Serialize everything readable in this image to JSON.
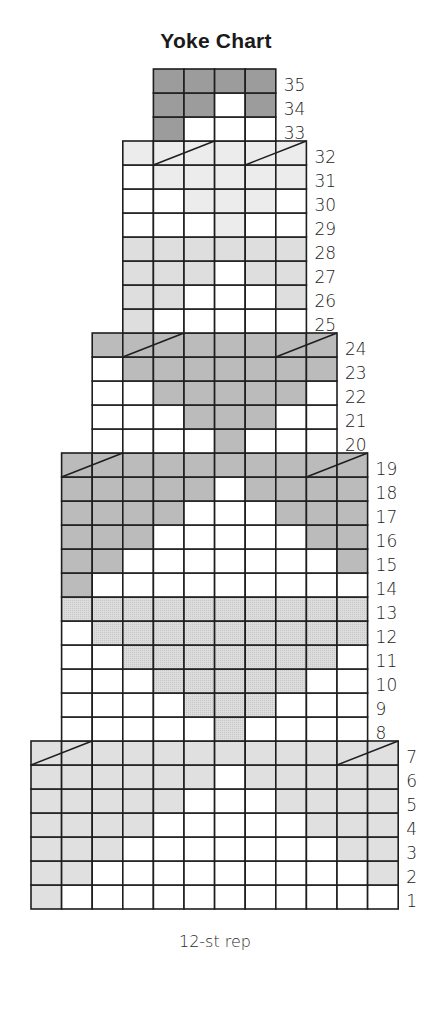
{
  "chart_data": {
    "type": "heatmap",
    "title": "Yoke Chart",
    "xlabel": "12-st rep",
    "ylabel": "",
    "legend": "none",
    "max_columns": 12,
    "shade_keys": {
      "W": {
        "name": "white",
        "color": "#ffffff"
      },
      "L": {
        "name": "light gray",
        "color": "#e0e0e0"
      },
      "D": {
        "name": "dotted light gray",
        "color": "#d9d9d9"
      },
      "M": {
        "name": "medium gray",
        "color": "#bbbbbb"
      },
      "P": {
        "name": "pale gray",
        "color": "#ececec"
      },
      "Q": {
        "name": "soft gray",
        "color": "#dedede"
      },
      "K": {
        "name": "dark gray",
        "color": "#9c9c9c"
      }
    },
    "rows": [
      {
        "row": 1,
        "cells": "LWWWWWWWWWWW"
      },
      {
        "row": 2,
        "cells": "LLWWWWWWWWWL"
      },
      {
        "row": 3,
        "cells": "LLLWWWWWWWLL"
      },
      {
        "row": 4,
        "cells": "LLLLWWWWWLLL"
      },
      {
        "row": 5,
        "cells": "LLLLLWWWLLLL"
      },
      {
        "row": 6,
        "cells": "LLLLLLWLLLLL"
      },
      {
        "row": 7,
        "cells": "LLLLLLLLLLLL",
        "decreases": [
          [
            1,
            2
          ],
          [
            11,
            12
          ]
        ]
      },
      {
        "row": 8,
        "cells": "WWWWWDWWWW"
      },
      {
        "row": 9,
        "cells": "WWWWDDDWWW"
      },
      {
        "row": 10,
        "cells": "WWWDDDDDWW"
      },
      {
        "row": 11,
        "cells": "WWDDDDDDDW"
      },
      {
        "row": 12,
        "cells": "WDDDDDDDDD"
      },
      {
        "row": 13,
        "cells": "DDDDDDDDDD"
      },
      {
        "row": 14,
        "cells": "MWWWWWWWWW"
      },
      {
        "row": 15,
        "cells": "MMWWWWWWWM"
      },
      {
        "row": 16,
        "cells": "MMMWWWWWMM"
      },
      {
        "row": 17,
        "cells": "MMMMWWWMMM"
      },
      {
        "row": 18,
        "cells": "MMMMMWMMMM"
      },
      {
        "row": 19,
        "cells": "MMMMMMMMMM",
        "decreases": [
          [
            1,
            2
          ],
          [
            9,
            10
          ]
        ]
      },
      {
        "row": 20,
        "cells": "WWWWMWWW"
      },
      {
        "row": 21,
        "cells": "WWWMMMWW"
      },
      {
        "row": 22,
        "cells": "WWMMMMMW"
      },
      {
        "row": 23,
        "cells": "WMMMMMMM"
      },
      {
        "row": 24,
        "cells": "MMMMMMMM",
        "decreases": [
          [
            2,
            3
          ],
          [
            7,
            8
          ]
        ]
      },
      {
        "row": 25,
        "cells": "QWWWWW"
      },
      {
        "row": 26,
        "cells": "QQWWWQ"
      },
      {
        "row": 27,
        "cells": "QQQWQQ"
      },
      {
        "row": 28,
        "cells": "QQQQQQ"
      },
      {
        "row": 29,
        "cells": "WWWPWW"
      },
      {
        "row": 30,
        "cells": "WWPPPW"
      },
      {
        "row": 31,
        "cells": "WPPPPP"
      },
      {
        "row": 32,
        "cells": "PPPPPP",
        "decreases": [
          [
            2,
            3
          ],
          [
            5,
            6
          ]
        ]
      },
      {
        "row": 33,
        "cells": "KWWW"
      },
      {
        "row": 34,
        "cells": "KKWK"
      },
      {
        "row": 35,
        "cells": "KKKK"
      }
    ]
  }
}
